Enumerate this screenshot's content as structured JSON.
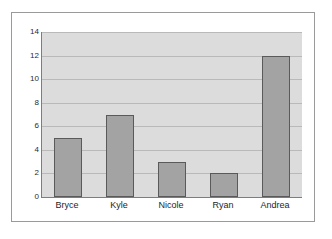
{
  "chart_data": {
    "type": "bar",
    "title": "",
    "subtitle": "",
    "xlabel": "",
    "ylabel": "",
    "categories": [
      "Bryce",
      "Kyle",
      "Nicole",
      "Ryan",
      "Andrea"
    ],
    "values": [
      5,
      7,
      3,
      2,
      12
    ],
    "series": [
      {
        "name": "",
        "values": [
          5,
          7,
          3,
          2,
          12
        ]
      }
    ],
    "ylim": [
      0,
      14
    ],
    "y_ticks": [
      0,
      2,
      4,
      6,
      8,
      10,
      12,
      14
    ],
    "y_tick_labels": [
      "0",
      "2",
      "4",
      "6",
      "8",
      "10",
      "12",
      "14"
    ],
    "grid": true,
    "grid_axis": "y",
    "legend": false,
    "legend_position": "none",
    "annotations": [],
    "colors": {
      "bar_fill": "#a3a3a3",
      "bar_border": "#5a5a5a",
      "plot_background": "#dcdcdc",
      "gridline": "#b9b9b9",
      "axis_line": "#7d7d7d",
      "frame_border": "#9a9a9a",
      "page_background": "#ffffff",
      "tick_label": "#2b2b2b",
      "category_label": "#1e1e1e"
    }
  }
}
